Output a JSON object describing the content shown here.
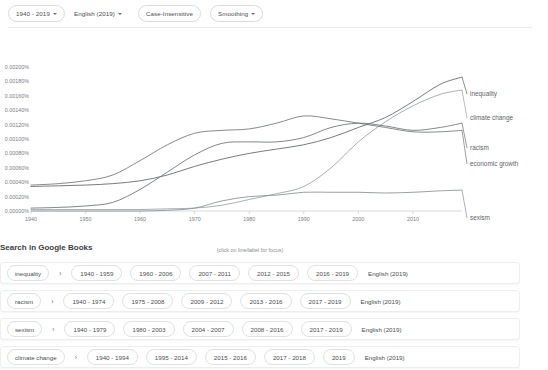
{
  "toolbar": {
    "year_range": "1940 - 2019",
    "corpus": "English (2019)",
    "case": "Case-Insensitive",
    "smoothing": "Smoothing"
  },
  "chart_caption": "(click on line/label for focus)",
  "books": {
    "heading": "Search in Google Books",
    "arrow_glyph": "›",
    "rows": [
      {
        "term": "inequality",
        "ranges": [
          "1940 - 1959",
          "1960 - 2006",
          "2007 - 2011",
          "2012 - 2015",
          "2016 - 2019"
        ],
        "lang": "English (2019)"
      },
      {
        "term": "racism",
        "ranges": [
          "1940 - 1974",
          "1975 - 2008",
          "2009 - 2012",
          "2013 - 2016",
          "2017 - 2019"
        ],
        "lang": "English (2019)"
      },
      {
        "term": "sexism",
        "ranges": [
          "1940 - 1979",
          "1980 - 2003",
          "2004 - 2007",
          "2008 - 2016",
          "2017 - 2019"
        ],
        "lang": "English (2019)"
      },
      {
        "term": "climate change",
        "ranges": [
          "1940 - 1994",
          "1995 - 2014",
          "2015 - 2016",
          "2017 - 2018",
          "2019"
        ],
        "lang": "English (2019)"
      }
    ]
  },
  "chart_data": {
    "type": "line",
    "title": "",
    "xlabel": "",
    "ylabel": "",
    "grid": false,
    "legend_position": "right-inline-labels",
    "xlim": [
      1940,
      2019
    ],
    "ylim": [
      0.0,
      0.002
    ],
    "x_ticks": [
      1940,
      1950,
      1960,
      1970,
      1980,
      1990,
      2000,
      2010
    ],
    "y_ticks": [
      "0.00000%",
      "0.00020%",
      "0.00040%",
      "0.00060%",
      "0.00080%",
      "0.00100%",
      "0.00120%",
      "0.00140%",
      "0.00160%",
      "0.00180%",
      "0.00200%"
    ],
    "y_tick_values": [
      0.0,
      0.0002,
      0.0004,
      0.0006,
      0.0008,
      0.001,
      0.0012,
      0.0014,
      0.0016,
      0.0018,
      0.002
    ],
    "x": [
      1940,
      1945,
      1950,
      1955,
      1960,
      1965,
      1970,
      1975,
      1980,
      1985,
      1990,
      1995,
      2000,
      2005,
      2010,
      2015,
      2019
    ],
    "series": [
      {
        "name": "inequality",
        "color": "#5f6368",
        "values": [
          0.00034,
          0.00035,
          0.00036,
          0.00038,
          0.00042,
          0.0005,
          0.00062,
          0.00072,
          0.0008,
          0.00086,
          0.00092,
          0.00102,
          0.00116,
          0.0013,
          0.00152,
          0.00176,
          0.00186
        ]
      },
      {
        "name": "climate change",
        "color": "#9aa0a6",
        "values": [
          2e-05,
          2e-05,
          2e-05,
          2e-05,
          2e-05,
          3e-05,
          4e-05,
          8e-05,
          0.00016,
          0.00024,
          0.00034,
          0.0006,
          0.00096,
          0.00124,
          0.00146,
          0.00162,
          0.00168
        ]
      },
      {
        "name": "racism",
        "color": "#6b7073",
        "values": [
          4e-05,
          5e-05,
          7e-05,
          0.00012,
          0.0003,
          0.00054,
          0.00078,
          0.00094,
          0.00096,
          0.00096,
          0.00102,
          0.00116,
          0.00122,
          0.00118,
          0.00112,
          0.00116,
          0.00122
        ]
      },
      {
        "name": "economic growth",
        "color": "#70757a",
        "values": [
          0.00036,
          0.00038,
          0.00042,
          0.0005,
          0.0007,
          0.00092,
          0.00108,
          0.00112,
          0.00114,
          0.00122,
          0.00132,
          0.00128,
          0.00122,
          0.00116,
          0.0011,
          0.0011,
          0.00112
        ]
      },
      {
        "name": "sexism",
        "color": "#8a8f93",
        "values": [
          0.0,
          0.0,
          0.0,
          0.0,
          0.0,
          1e-05,
          4e-05,
          0.00014,
          0.0002,
          0.00022,
          0.00026,
          0.00026,
          0.00026,
          0.00025,
          0.00026,
          0.00028,
          0.00029
        ]
      }
    ]
  }
}
